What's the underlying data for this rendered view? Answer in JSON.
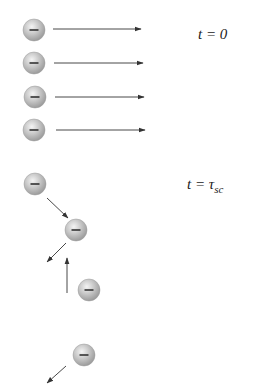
{
  "diagram": {
    "colors": {
      "electron_fill": "#b8b8b8",
      "electron_highlight": "#f2f2f2",
      "electron_edge": "#9a9a9a",
      "minus_sign": "#333333",
      "arrow": "#333333",
      "background": "#ffffff"
    },
    "electron_radius": 11,
    "electron_symbol": "−",
    "panels": [
      {
        "label_t": "t = 0",
        "label_pos": [
          198,
          26
        ],
        "electrons": [
          {
            "cx": 34,
            "cy": 30
          },
          {
            "cx": 34,
            "cy": 63
          },
          {
            "cx": 35,
            "cy": 97
          },
          {
            "cx": 34,
            "cy": 130
          }
        ],
        "arrows": [
          {
            "x1": 53,
            "y1": 29,
            "x2": 141,
            "y2": 29
          },
          {
            "x1": 54,
            "y1": 63,
            "x2": 143,
            "y2": 63
          },
          {
            "x1": 55,
            "y1": 97,
            "x2": 144,
            "y2": 97
          },
          {
            "x1": 56,
            "y1": 130,
            "x2": 145,
            "y2": 130
          }
        ]
      },
      {
        "label_t": "t = τ",
        "label_sub": "sc",
        "label_pos": [
          187,
          176
        ],
        "electrons": [
          {
            "cx": 35,
            "cy": 184
          },
          {
            "cx": 76,
            "cy": 230
          },
          {
            "cx": 89,
            "cy": 290
          },
          {
            "cx": 84,
            "cy": 355
          }
        ],
        "arrows": [
          {
            "x1": 47,
            "y1": 198,
            "x2": 68,
            "y2": 218
          },
          {
            "x1": 66,
            "y1": 243,
            "x2": 47,
            "y2": 262
          },
          {
            "x1": 67,
            "y1": 293,
            "x2": 67,
            "y2": 258
          },
          {
            "x1": 66,
            "y1": 366,
            "x2": 47,
            "y2": 383
          }
        ]
      }
    ]
  }
}
